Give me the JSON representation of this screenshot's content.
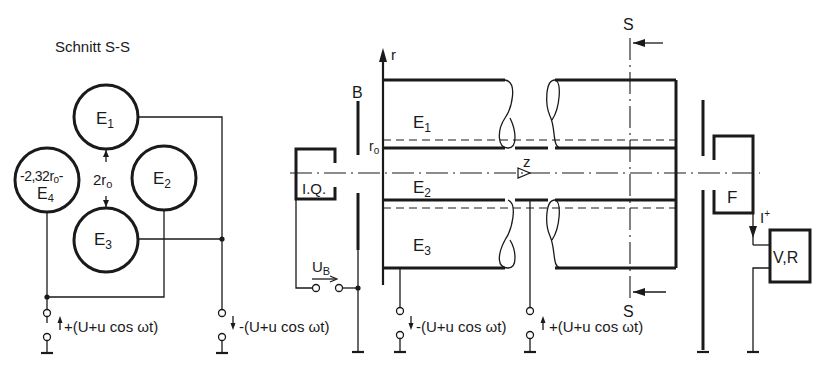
{
  "figure": {
    "type": "quadrupole mass filter schematic",
    "section_view": {
      "title": "Schnitt S-S",
      "electrodes": [
        "E1",
        "E2",
        "E3",
        "E4"
      ],
      "dimension_electrode": "2,32r0",
      "dimension_gap": "2r0",
      "supply_positive": "+(U+u cos ωt)",
      "supply_negative": "-(U+u cos ωt)"
    },
    "longitudinal_view": {
      "axis_r": "r",
      "axis_z": "z",
      "radius_label": "r0",
      "aperture_label": "B",
      "ion_source_label": "I.Q.",
      "electrode_labels": [
        "E1",
        "E2",
        "E3"
      ],
      "section_marker": "S",
      "accelerating_voltage": "UB",
      "supply_negative": "-(U+u cos ωt)",
      "supply_positive": "+(U+u cos ωt)",
      "detector_label": "F",
      "current_label": "I+",
      "amplifier_label": "V,R"
    }
  }
}
